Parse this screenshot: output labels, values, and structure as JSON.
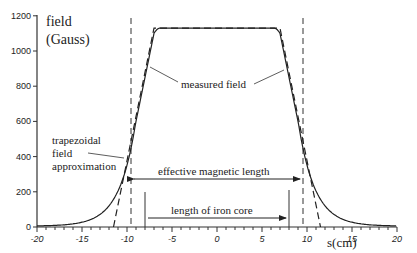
{
  "chart_data": {
    "type": "line",
    "title": "",
    "ylabel_line1": "field",
    "ylabel_line2": "(Gauss)",
    "xlabel": "s(cm)",
    "xlim": [
      -20,
      20
    ],
    "ylim": [
      0,
      1200
    ],
    "xticks": [
      "-20",
      "-15",
      "-10",
      "-5",
      "0",
      "5",
      "10",
      "15",
      "20"
    ],
    "yticks": [
      "0",
      "200",
      "400",
      "600",
      "800",
      "1000",
      "1200"
    ],
    "grid": false,
    "series": [
      {
        "name": "measured field",
        "style": "solid",
        "x": [
          -20,
          -15,
          -12,
          -10,
          -9,
          -8,
          -7,
          -6.5,
          -6,
          6,
          6.5,
          7,
          8,
          9,
          10,
          12,
          15,
          20
        ],
        "y": [
          10,
          40,
          120,
          330,
          600,
          900,
          1100,
          1130,
          1130,
          1130,
          1130,
          1100,
          900,
          600,
          330,
          120,
          40,
          10
        ]
      },
      {
        "name": "trapezoidal field approximation",
        "style": "dashed",
        "x": [
          -11.5,
          -7,
          7,
          11.5
        ],
        "y": [
          0,
          1130,
          1130,
          0
        ]
      }
    ],
    "annotations": [
      {
        "text": "measured field"
      },
      {
        "text": "trapezoidal field approximation"
      },
      {
        "text": "effective magnetic length",
        "from": -9.6,
        "to": 9.6
      },
      {
        "text": "length of iron core",
        "from": -8,
        "to": 8
      }
    ]
  },
  "labels": {
    "measured": "measured field",
    "trap1": "trapezoidal",
    "trap2": "field",
    "trap3": "approximation",
    "eff": "effective magnetic length",
    "iron": "length of iron core"
  }
}
